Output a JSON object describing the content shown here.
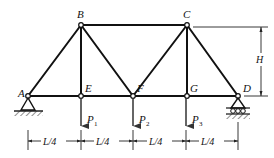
{
  "diagram": {
    "type": "truss",
    "nodes": {
      "A": {
        "label": "A"
      },
      "B": {
        "label": "B"
      },
      "C": {
        "label": "C"
      },
      "D": {
        "label": "D"
      },
      "E": {
        "label": "E"
      },
      "F": {
        "label": "F"
      },
      "G": {
        "label": "G"
      }
    },
    "members": [
      "AB",
      "AE",
      "BE",
      "BF",
      "BC",
      "EF",
      "FC",
      "FG",
      "CG",
      "CD",
      "GD"
    ],
    "loads": [
      {
        "node": "E",
        "label": "P",
        "subscript": "1"
      },
      {
        "node": "F",
        "label": "P",
        "subscript": "2"
      },
      {
        "node": "G",
        "label": "P",
        "subscript": "3"
      }
    ],
    "supports": {
      "A": "pin",
      "D": "roller"
    },
    "dimensions": {
      "spans": [
        "L/4",
        "L/4",
        "L/4",
        "L/4"
      ],
      "height": "H"
    },
    "colors": {
      "stroke": "#111111",
      "background": "#ffffff"
    }
  }
}
